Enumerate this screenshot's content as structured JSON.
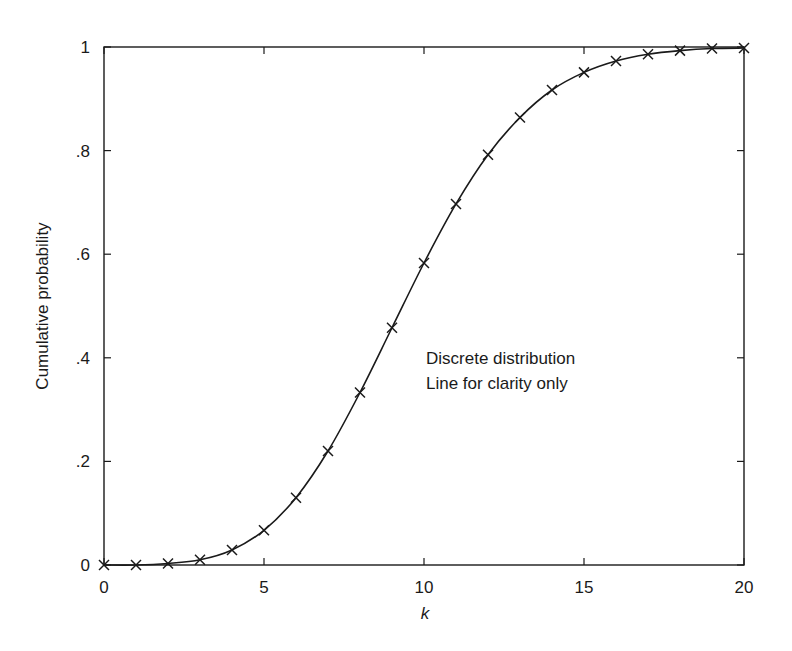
{
  "chart_data": {
    "type": "line",
    "title": "",
    "xlabel": "k",
    "ylabel": "Cumulative probability",
    "xlim": [
      0,
      20
    ],
    "ylim": [
      0,
      1
    ],
    "grid": false,
    "legend": null,
    "x_ticks": [
      0,
      5,
      10,
      15,
      20
    ],
    "x_tick_labels": [
      "0",
      "5",
      "10",
      "15",
      "20"
    ],
    "y_ticks": [
      0,
      0.2,
      0.4,
      0.6,
      0.8,
      1
    ],
    "y_tick_labels": [
      "0",
      ".2",
      ".4",
      ".6",
      ".8",
      "1"
    ],
    "marker": "x",
    "series": [
      {
        "name": "Cumulative probability",
        "x": [
          0,
          1,
          2,
          3,
          4,
          5,
          6,
          7,
          8,
          9,
          10,
          11,
          12,
          13,
          14,
          15,
          16,
          17,
          18,
          19,
          20
        ],
        "values": [
          0.0,
          0.0,
          0.003,
          0.01,
          0.029,
          0.067,
          0.13,
          0.22,
          0.333,
          0.458,
          0.583,
          0.697,
          0.792,
          0.864,
          0.917,
          0.951,
          0.973,
          0.986,
          0.993,
          0.997,
          0.998
        ]
      }
    ],
    "annotations": [
      {
        "text": "Discrete distribution",
        "x": 12.5,
        "y": 0.41
      },
      {
        "text": "Line for clarity only",
        "x": 12.5,
        "y": 0.365
      }
    ]
  },
  "labels": {
    "xlabel": "k",
    "ylabel": "Cumulative probability",
    "annotation_line1": "Discrete distribution",
    "annotation_line2": "Line for clarity only"
  },
  "colors": {
    "line": "#1a1a1a",
    "axis": "#1a1a1a",
    "background": "#ffffff"
  }
}
